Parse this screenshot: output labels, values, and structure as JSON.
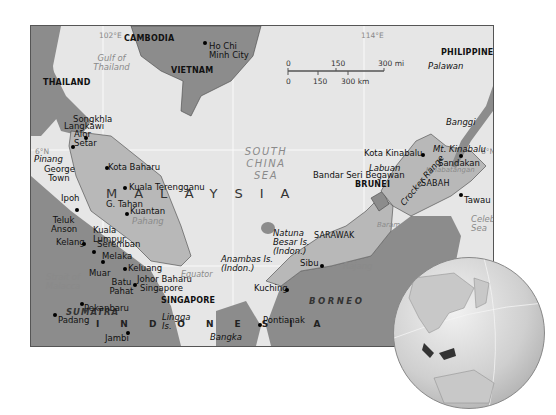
{
  "map": {
    "title": "Malaysia",
    "colors": {
      "sea": "#e6e6e6",
      "malaysia": "#b8b8b8",
      "neighbors": "#8c8c8c",
      "highlight": "#555555",
      "frame": "#555555"
    },
    "graticule": {
      "lon_labels": [
        "102°E",
        "114°E"
      ],
      "lat_labels": [
        "6°N",
        "6°N"
      ],
      "equator_label": "Equator"
    },
    "countries": [
      "CAMBODIA",
      "VIETNAM",
      "THAILAND",
      "PHILIPPINES",
      "BRUNEI",
      "SINGAPORE"
    ],
    "country_big": {
      "malaysia": "MALAYSIA",
      "indonesia": "INDONESIA",
      "malay_peninsula": "MALAY PENINSULA"
    },
    "states": [
      "SARAWAK",
      "SABAH"
    ],
    "islands": [
      "SUMATRA",
      "BORNEO",
      "Palawan",
      "Banggi",
      "Labuan",
      "Pinang",
      "Langkawi",
      "Natuna Besar Is. (Indon.)",
      "Anambas Is. (Indon.)",
      "Lingga Is.",
      "Bangka"
    ],
    "waters": [
      "Gulf of Thailand",
      "SOUTH CHINA SEA",
      "Sulu Sea",
      "Celebes Sea",
      "Strait of Malacca"
    ],
    "rivers": [
      "Pahang",
      "Rajang",
      "Baram",
      "Kinabatangan"
    ],
    "features": [
      "G. Tahan",
      "Mt. Kinabalu",
      "Crocker Range"
    ],
    "cities": [
      "Ho Chi Minh City",
      "Songkhla",
      "Alor Setar",
      "Kota Baharu",
      "George Town",
      "Kuala Terengganu",
      "Ipoh",
      "Teluk Anson",
      "Kuala Lumpur",
      "Kuantan",
      "Kelang",
      "Seremban",
      "Melaka",
      "Muar",
      "Batu Pahat",
      "Keluang",
      "Johor Baharu",
      "Singapore",
      "Pekanbaru",
      "Padang",
      "Jambi",
      "Pontianak",
      "Kuching",
      "Sibu",
      "Bandar Seri Begawan",
      "Kota Kinabalu",
      "Sandakan",
      "Tawau"
    ],
    "scale_bar": {
      "mi": [
        "0",
        "150",
        "300 mi"
      ],
      "km": [
        "0",
        "150",
        "300 km"
      ]
    }
  }
}
